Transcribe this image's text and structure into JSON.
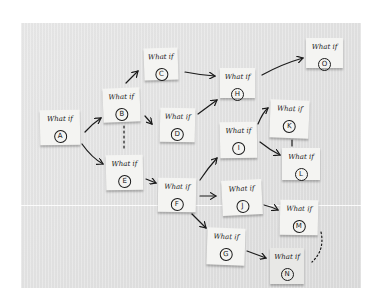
{
  "scene": {
    "description": "Photo of sticky notes on a wall forming a branching 'What if' scenario map",
    "background_color": "#ffffff",
    "wall_color": "#e4e4e4",
    "note_color": "#f4f4f2",
    "ink_color": "#1a1a1a"
  },
  "notes": [
    {
      "id": "A",
      "label": "What if",
      "letter": "A"
    },
    {
      "id": "B",
      "label": "What if",
      "letter": "B"
    },
    {
      "id": "C",
      "label": "What if",
      "letter": "C"
    },
    {
      "id": "D",
      "label": "What if",
      "letter": "D"
    },
    {
      "id": "E",
      "label": "What if",
      "letter": "E"
    },
    {
      "id": "F",
      "label": "What if",
      "letter": "F"
    },
    {
      "id": "G",
      "label": "What if",
      "letter": "G"
    },
    {
      "id": "H",
      "label": "What if",
      "letter": "H"
    },
    {
      "id": "I",
      "label": "What if",
      "letter": "I"
    },
    {
      "id": "J",
      "label": "What if",
      "letter": "J"
    },
    {
      "id": "K",
      "label": "What if",
      "letter": "K"
    },
    {
      "id": "L",
      "label": "What if",
      "letter": "L"
    },
    {
      "id": "M",
      "label": "What if",
      "letter": "M"
    },
    {
      "id": "N",
      "label": "What if",
      "letter": "N"
    },
    {
      "id": "O",
      "label": "What if",
      "letter": "O"
    }
  ],
  "connections": [
    {
      "from": "A",
      "to": "B",
      "style": "solid"
    },
    {
      "from": "A",
      "to": "E",
      "style": "solid"
    },
    {
      "from": "B",
      "to": "C",
      "style": "solid"
    },
    {
      "from": "B",
      "to": "D",
      "style": "solid"
    },
    {
      "from": "B",
      "to": "E",
      "style": "dashed"
    },
    {
      "from": "C",
      "to": "H",
      "style": "solid"
    },
    {
      "from": "D",
      "to": "H",
      "style": "solid"
    },
    {
      "from": "H",
      "to": "O",
      "style": "solid"
    },
    {
      "from": "E",
      "to": "F",
      "style": "solid"
    },
    {
      "from": "F",
      "to": "I",
      "style": "solid"
    },
    {
      "from": "F",
      "to": "J",
      "style": "solid"
    },
    {
      "from": "F",
      "to": "G",
      "style": "solid"
    },
    {
      "from": "I",
      "to": "K",
      "style": "solid"
    },
    {
      "from": "I",
      "to": "L",
      "style": "solid"
    },
    {
      "from": "K",
      "to": "L",
      "style": "solid"
    },
    {
      "from": "J",
      "to": "M",
      "style": "solid"
    },
    {
      "from": "G",
      "to": "N",
      "style": "solid"
    },
    {
      "from": "M",
      "to": "N",
      "style": "dotted"
    }
  ]
}
